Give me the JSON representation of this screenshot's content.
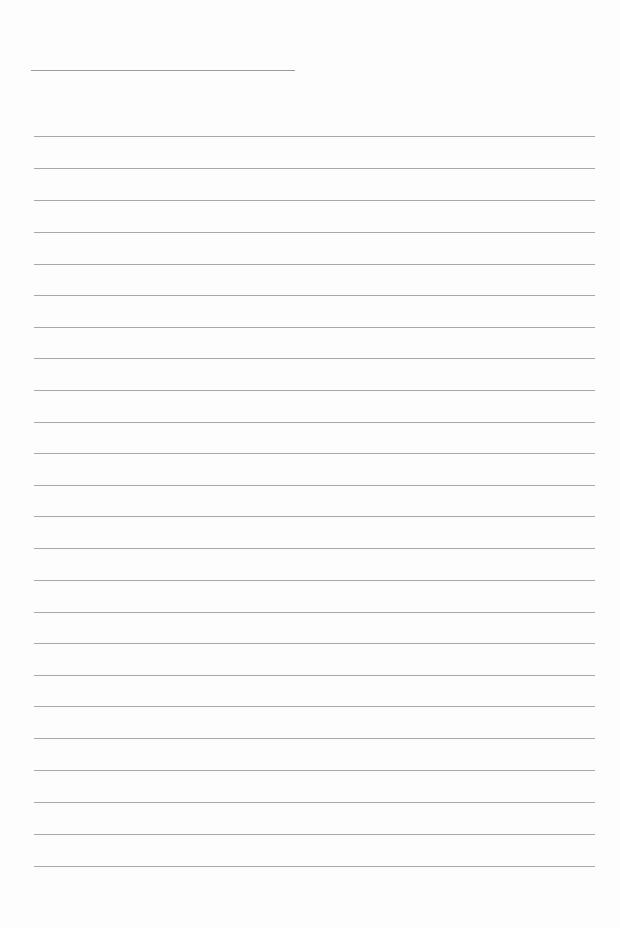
{
  "page": {
    "type": "lined-notepad",
    "background": "#fdfdfd",
    "line_color": "#a8a8a8",
    "title_line": {
      "x": 31,
      "y": 70,
      "width": 264
    },
    "rules": {
      "x": 34,
      "width": 561,
      "y_positions": [
        136,
        168,
        200,
        232,
        264,
        295,
        327,
        358,
        390,
        422,
        453,
        485,
        516,
        548,
        580,
        612,
        643,
        675,
        706,
        738,
        770,
        802,
        834,
        866
      ]
    }
  }
}
